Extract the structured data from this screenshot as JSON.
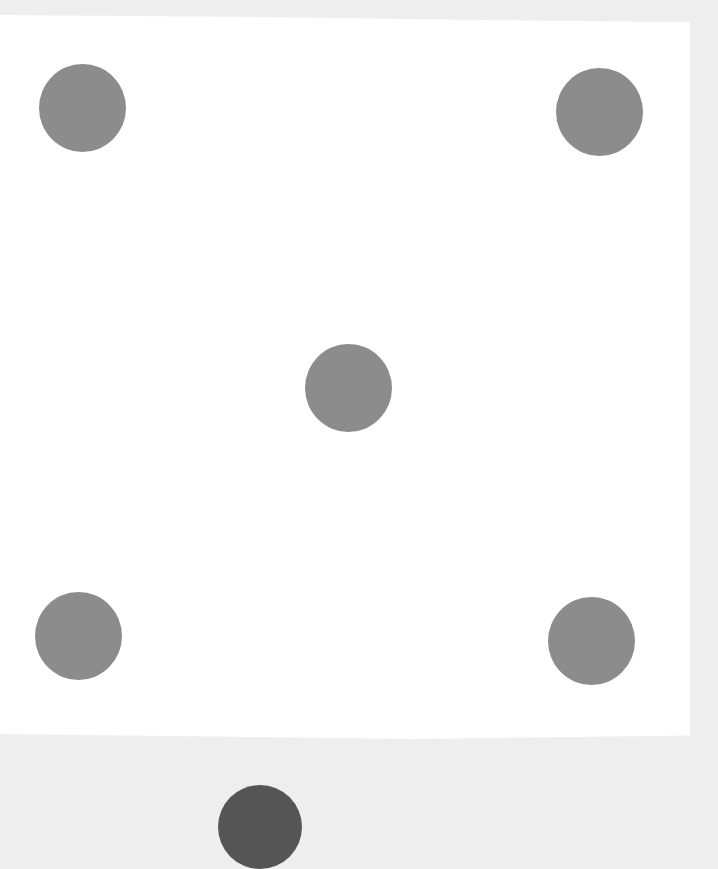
{
  "scene": {
    "description": "Close-up photo of a white die face showing five gray pips",
    "background_color": "#eeeeee",
    "face_color": "#ffffff",
    "pip_color": "#8c8c8c",
    "face_value": 5
  },
  "pips": [
    {
      "name": "top-left",
      "cx": 82,
      "cy": 108
    },
    {
      "name": "top-right",
      "cx": 599,
      "cy": 112
    },
    {
      "name": "center",
      "cx": 348,
      "cy": 388
    },
    {
      "name": "bottom-left",
      "cx": 79,
      "cy": 636
    },
    {
      "name": "bottom-right",
      "cx": 591,
      "cy": 641
    }
  ],
  "partial_pip": {
    "name": "bottom-edge-partial",
    "cx": 260,
    "cy": 827,
    "color": "#555555"
  }
}
